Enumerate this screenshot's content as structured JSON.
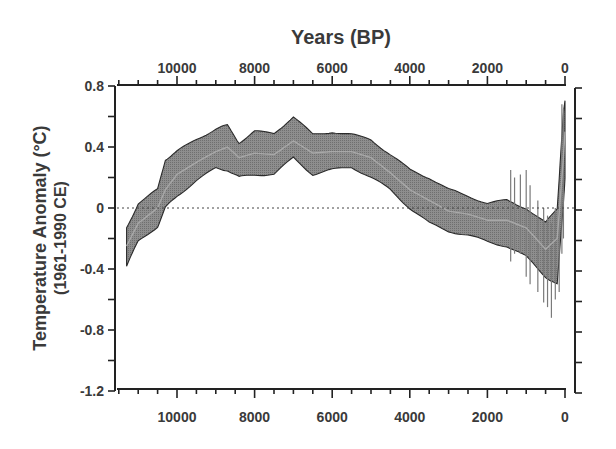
{
  "chart_data": {
    "type": "area",
    "title": "",
    "xlabel": "Years (BP)",
    "ylabel": "Temperature Anomaly (°C)",
    "ylabel_sub": "(1961-1990 CE)",
    "x_axis_reversed": true,
    "xlim": [
      11600,
      0
    ],
    "ylim": [
      -1.2,
      0.8
    ],
    "x_ticks_major": [
      10000,
      8000,
      6000,
      4000,
      2000,
      0
    ],
    "x_tick_labels": [
      "10000",
      "8000",
      "6000",
      "4000",
      "2000",
      "0"
    ],
    "x_minor_step": 500,
    "y_ticks_major": [
      0.8,
      0.4,
      0,
      -0.4,
      -0.8,
      -1.2
    ],
    "y_tick_labels": [
      "0.8",
      "0.4",
      "0",
      "-0.4",
      "-0.8",
      "-1.2"
    ],
    "y_minor_step": 0.2,
    "zero_line": {
      "style": "dotted",
      "value": 0
    },
    "grid": false,
    "legend": null,
    "x": [
      11300,
      11000,
      10500,
      10300,
      10000,
      9500,
      9000,
      8700,
      8400,
      8000,
      7500,
      7000,
      6500,
      6000,
      5500,
      5000,
      4500,
      4000,
      3500,
      3000,
      2500,
      2000,
      1500,
      1000,
      500,
      200,
      50,
      0
    ],
    "series": [
      {
        "name": "upper",
        "values": [
          -0.13,
          0.03,
          0.12,
          0.32,
          0.37,
          0.45,
          0.52,
          0.54,
          0.43,
          0.5,
          0.49,
          0.6,
          0.48,
          0.5,
          0.48,
          0.45,
          0.35,
          0.25,
          0.2,
          0.12,
          0.08,
          0.03,
          0.05,
          0.0,
          -0.1,
          0.0,
          0.6,
          0.7
        ]
      },
      {
        "name": "mean",
        "values": [
          -0.25,
          -0.1,
          0.0,
          0.12,
          0.22,
          0.3,
          0.37,
          0.4,
          0.33,
          0.36,
          0.35,
          0.44,
          0.36,
          0.37,
          0.37,
          0.33,
          0.23,
          0.12,
          0.05,
          -0.02,
          -0.04,
          -0.08,
          -0.08,
          -0.13,
          -0.27,
          -0.2,
          0.3,
          0.5
        ]
      },
      {
        "name": "lower",
        "values": [
          -0.38,
          -0.22,
          -0.12,
          0.0,
          0.08,
          0.18,
          0.26,
          0.25,
          0.2,
          0.22,
          0.22,
          0.33,
          0.22,
          0.25,
          0.27,
          0.2,
          0.12,
          0.0,
          -0.1,
          -0.15,
          -0.18,
          -0.22,
          -0.25,
          -0.32,
          -0.45,
          -0.5,
          0.0,
          0.2
        ]
      }
    ],
    "colors": {
      "band_fill": "#8a8a8a",
      "band_edge": "#2a2a2a",
      "mean_line": "#a8a8a8",
      "axis": "#222222",
      "text": "#3a3a3a"
    }
  }
}
